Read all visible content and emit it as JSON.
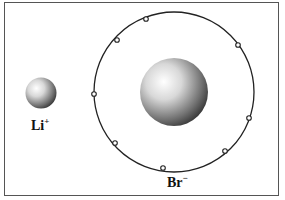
{
  "diagram": {
    "type": "ion-comparison",
    "cation": {
      "symbol": "Li",
      "charge": "+"
    },
    "anion": {
      "symbol": "Br",
      "charge": "−"
    },
    "outer_shell_electron_count": 8
  }
}
